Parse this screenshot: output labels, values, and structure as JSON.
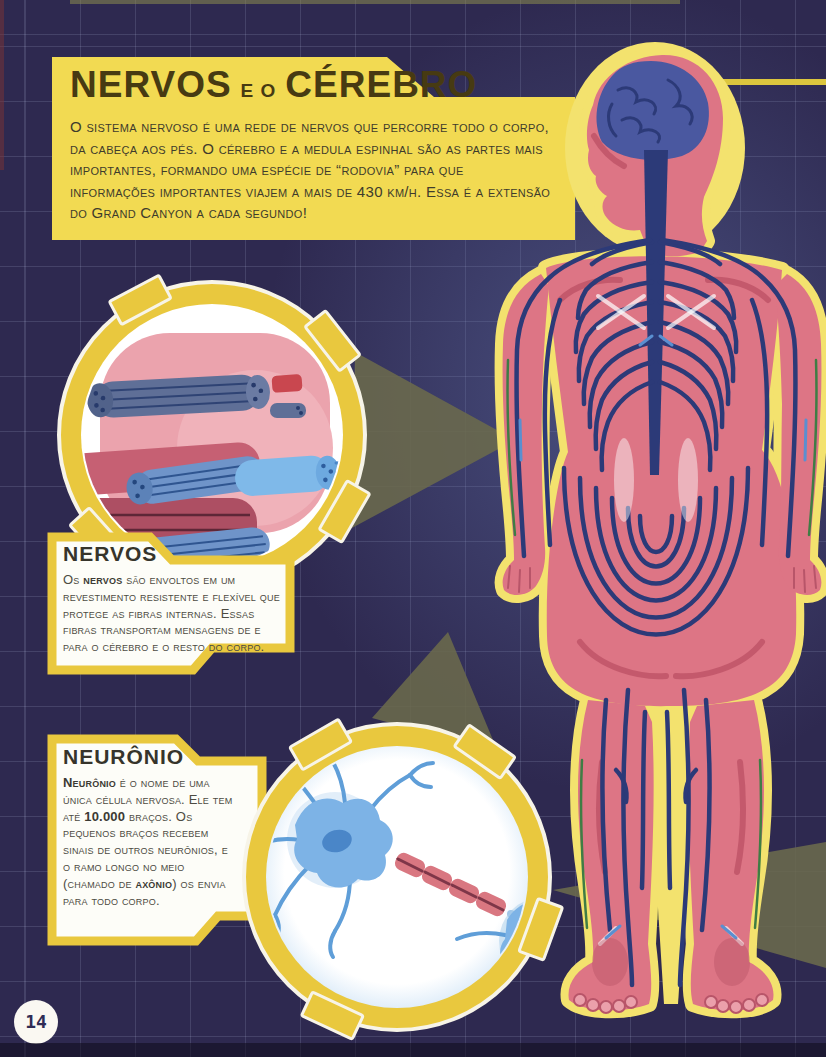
{
  "page": {
    "number": "14"
  },
  "title_box": {
    "title_part1": "NERVOS",
    "title_connector": "E O",
    "title_part2": "CÉREBRO",
    "body": "O sistema nervoso é uma rede de nervos que percorre todo o corpo, da cabeça aos pés. O cérebro e a medula espinhal são as partes mais importantes, formando uma espécie de “rodovia” para que informações importantes viajem a mais de 430 km/h. Essa é a extensão do Grand Canyon a cada segundo!"
  },
  "nervos_box": {
    "title": "NERVOS",
    "lead": "Os ",
    "bold": "nervos",
    "rest": " são envoltos em um revestimento resistente e flexível que protege as fibras internas. Essas fibras transportam mensagens de e para o cérebro e o resto do corpo."
  },
  "neuronio_box": {
    "title": "NEURÔNIO",
    "bold1": "Neurônio",
    "part1": " é o nome de uma única célula nervosa. Ele tem até ",
    "bold2": "10.000",
    "part2": " braços. Os pequenos braços recebem sinais de outros neurônios, e o ramo longo no meio (chamado de ",
    "bold3": "axônio",
    "part3": ") os envia para todo corpo."
  },
  "illustrations": {
    "body_figure": "human-nervous-system-back-view",
    "nerve_inset": "nerve-fiber-bundle-magnified",
    "neuron_inset": "neurons-with-myelinated-axon"
  },
  "colors": {
    "page_bg": "#2e2950",
    "panel_yellow": "#f2da52",
    "ring_yellow": "#e9c83e",
    "body_pink": "#dd7585",
    "body_glow_yellow": "#f3e26e",
    "nerve_blue": "#2c3a78",
    "beam_olive": "#6b6a4c",
    "neuron_blue": "#7db3e6",
    "myelin_pink": "#d97781"
  }
}
